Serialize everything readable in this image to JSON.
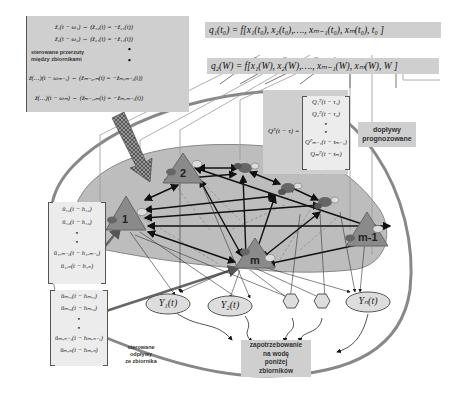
{
  "equations": {
    "q1": "q₁(t₀) = f[x₁(t₀), x₂(t₀),…., xₘ₋₁(t₀), xₘ(t₀), t₀ ]",
    "q2": "q₂(W) = f[x₁(W), x₂(W),…., xₘ₋₁(W), xₘ(W), W ]"
  },
  "transfer_matrix": {
    "rows": [
      "ẑ₁(t − ω₁) ⇔ (ẑ₁₂(t) = −ẑ₂₁(t))",
      "ẑ₂(t − ω₂) ⇔ (ẑ₂₁(t) = −ẑ₁₁(t))",
      "ẑ(…)(t − ωₘ₋₁) ⇔ (ẑₘ₋₂,ₘ(t) = −ẑₘ,ₘ₋₂(t))",
      "ẑ(…)(t − ωₘ) ⇔ (ẑₘ₋₁,ₘ(t) = −ẑₘ,ₘ₋₁(t))"
    ],
    "label_line1": "sterowane   przerzuty",
    "label_line2": "między    zbiornikami"
  },
  "forecast_matrix": {
    "lhs": "Qᴾ(t − τ) =",
    "rows": [
      "Q₁ᴾ(t − τ₁)",
      "Q₂ᴾ(t − τ₂)",
      "•",
      "•",
      "Qᴾₘ₋₁(t − τₘ₋₁)",
      "Qₘᴾ(t − τₘ)"
    ]
  },
  "forecast_label": {
    "line1": "dopływy",
    "line2": "prognozowane"
  },
  "inter_matrix": {
    "rows": [
      "û₁₂(t − h₁₂)",
      "û₁₂(t − h₁₂)",
      "•",
      "•",
      "û₁,ₘ₋₂(t − h₁,ₘ₋₂)",
      "û₁,ₙ(t − h₁ₙ)"
    ]
  },
  "outflow_matrix": {
    "rows": [
      "ûₘ,₁(t − hₘ,₁)",
      "ûₘ,₂(t − hₘ,₂)",
      "•",
      "•",
      "ûₘ,ₙ₋₁(t − hₘ,ₙ₋₁)",
      "ûₘ,ₙ(t − hₘ,ₙ)"
    ]
  },
  "outflow_label": {
    "line1": "sterowane",
    "line2": "odpływy",
    "line3": "ze zbiornika"
  },
  "reservoirs": [
    {
      "id": "1",
      "label": "1"
    },
    {
      "id": "2",
      "label": "2"
    },
    {
      "id": "m",
      "label": "m"
    },
    {
      "id": "m-1",
      "label": "m-1"
    }
  ],
  "demand_nodes": [
    {
      "label": "Y₁(t)"
    },
    {
      "label": "Y₂(t)"
    },
    {
      "label": "Yₙ(t)"
    }
  ],
  "demand_label": {
    "line1": "zapotrzebowanie",
    "line2": "na wodę",
    "line3": "poniżej",
    "line4": "zbiorników"
  },
  "colors": {
    "box": "#cfcfcf",
    "region": "#bdbdbd",
    "triangle": "#8a8a8a",
    "outline": "#777777"
  }
}
